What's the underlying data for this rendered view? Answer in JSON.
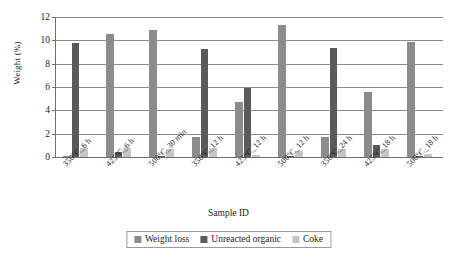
{
  "chart_data": {
    "type": "bar",
    "title": "",
    "xlabel": "Sample ID",
    "ylabel": "Weight (%)",
    "ylim": [
      0,
      12
    ],
    "ytick_values": [
      0,
      2,
      4,
      6,
      8,
      10,
      12
    ],
    "ytick_labels": [
      "0",
      "2",
      "4",
      "6",
      "8",
      "10",
      "12"
    ],
    "grid": true,
    "legend_position": "bottom-center",
    "categories": [
      "350°C_6 h",
      "425°C_6 h",
      "500°C_30 min",
      "350°C_12 h",
      "425°C_12 h",
      "500°C_12 h",
      "350°C_24 h",
      "425°C_18 h",
      "500°C_18 h"
    ],
    "series": [
      {
        "name": "Weight loss",
        "color": "#8c8c8c",
        "values": [
          0.1,
          10.55,
          10.85,
          1.75,
          4.7,
          11.35,
          1.7,
          5.6,
          9.9
        ]
      },
      {
        "name": "Unreacted organic",
        "color": "#5a5a5a",
        "values": [
          9.8,
          0.4,
          0.08,
          9.3,
          5.95,
          0.05,
          9.35,
          1.0,
          0.1
        ]
      },
      {
        "name": "Coke",
        "color": "#c6c6c6",
        "values": [
          0.75,
          0.75,
          0.65,
          0.75,
          0.15,
          0.55,
          0.7,
          0.65,
          0.25
        ]
      }
    ]
  },
  "axes": {
    "y_title": "Weight (%)",
    "x_title": "Sample ID"
  },
  "legend": {
    "entries": [
      {
        "label": "Weight loss",
        "color": "#8c8c8c"
      },
      {
        "label": "Unreacted organic",
        "color": "#5a5a5a"
      },
      {
        "label": "Coke",
        "color": "#c6c6c6"
      }
    ]
  }
}
